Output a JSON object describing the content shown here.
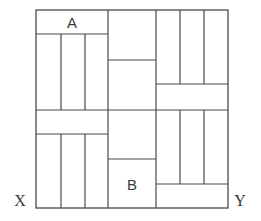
{
  "diagram": {
    "stroke_color": "#4a4a4a",
    "outer_square": {
      "x1": 36,
      "y1": 10,
      "x2": 228,
      "y2": 208
    },
    "labels": {
      "A": "A",
      "B": "B",
      "X": "X",
      "Y": "Y"
    },
    "label_positions": {
      "A": {
        "x": 72,
        "y": 28
      },
      "B": {
        "x": 132,
        "y": 190
      },
      "X": {
        "x": 20,
        "y": 206
      },
      "Y": {
        "x": 240,
        "y": 206
      }
    },
    "lines": [
      {
        "id": "col-left-right-edge",
        "x1": 108,
        "y1": 10,
        "x2": 108,
        "y2": 208
      },
      {
        "id": "col-mid-right-edge",
        "x1": 156,
        "y1": 10,
        "x2": 156,
        "y2": 208
      },
      {
        "id": "row-mid",
        "x1": 36,
        "y1": 110,
        "x2": 228,
        "y2": 110
      },
      {
        "id": "tl-band-bottom",
        "x1": 36,
        "y1": 34,
        "x2": 108,
        "y2": 34
      },
      {
        "id": "tl-v1",
        "x1": 61,
        "y1": 34,
        "x2": 61,
        "y2": 110
      },
      {
        "id": "tl-v2",
        "x1": 85,
        "y1": 34,
        "x2": 85,
        "y2": 110
      },
      {
        "id": "bl-band-bottom",
        "x1": 36,
        "y1": 134,
        "x2": 108,
        "y2": 134
      },
      {
        "id": "bl-v1",
        "x1": 61,
        "y1": 134,
        "x2": 61,
        "y2": 208
      },
      {
        "id": "bl-v2",
        "x1": 85,
        "y1": 134,
        "x2": 85,
        "y2": 208
      },
      {
        "id": "mid-top-split",
        "x1": 108,
        "y1": 60,
        "x2": 156,
        "y2": 60
      },
      {
        "id": "mid-bottom-split",
        "x1": 108,
        "y1": 159,
        "x2": 156,
        "y2": 159
      },
      {
        "id": "tr-band-top",
        "x1": 156,
        "y1": 84,
        "x2": 228,
        "y2": 84
      },
      {
        "id": "tr-v1",
        "x1": 180,
        "y1": 10,
        "x2": 180,
        "y2": 84
      },
      {
        "id": "tr-v2",
        "x1": 204,
        "y1": 10,
        "x2": 204,
        "y2": 84
      },
      {
        "id": "br-band-top",
        "x1": 156,
        "y1": 184,
        "x2": 228,
        "y2": 184
      },
      {
        "id": "br-v1",
        "x1": 180,
        "y1": 110,
        "x2": 180,
        "y2": 184
      },
      {
        "id": "br-v2",
        "x1": 204,
        "y1": 110,
        "x2": 204,
        "y2": 184
      }
    ]
  }
}
